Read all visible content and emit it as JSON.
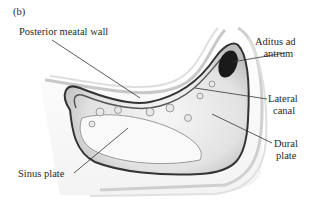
{
  "figure": {
    "panel_label": "(b)",
    "labels": {
      "posterior_meatal_wall": "Posterior meatal wall",
      "aditus_line1": "Aditus ad",
      "aditus_line2": "antrum",
      "lateral_line1": "Lateral",
      "lateral_line2": "canal",
      "dural_line1": "Dural",
      "dural_line2": "plate",
      "sinus_plate": "Sinus plate"
    }
  }
}
